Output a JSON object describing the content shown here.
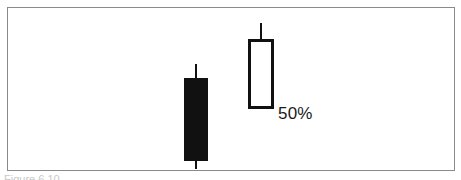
{
  "figure": {
    "caption": "Figure 6.10",
    "background_color": "#ffffff",
    "frame_color": "#8a8a8a"
  },
  "annotations": [
    {
      "id": "retracement",
      "text": "50%",
      "color": "#1a1a1a"
    }
  ],
  "chart_data": {
    "type": "candlestick",
    "title": "",
    "subtitle": "",
    "xlabel": "",
    "ylabel": "",
    "grid": false,
    "legend_position": "none",
    "axis_visible": false,
    "ylim": [
      0,
      100
    ],
    "annotations": [
      {
        "text": "50%",
        "attached_to": "session-2",
        "meaning": "50% retracement level of the prior black candle body"
      }
    ],
    "colors": {
      "bearish_body": "#111111",
      "bullish_body": "#ffffff",
      "outline": "#111111"
    },
    "categories": [
      "session-1",
      "session-2"
    ],
    "series": [
      {
        "name": "session-1",
        "direction": "bearish",
        "fill": "filled-black",
        "open": 72,
        "high": 81,
        "low": 19,
        "close": 24,
        "has_upper_wick": true,
        "has_lower_wick": true
      },
      {
        "name": "session-2",
        "direction": "bullish",
        "fill": "hollow-white",
        "open": 43,
        "high": 96,
        "low": 43,
        "close": 82,
        "has_upper_wick": true,
        "has_lower_wick": false
      }
    ]
  }
}
